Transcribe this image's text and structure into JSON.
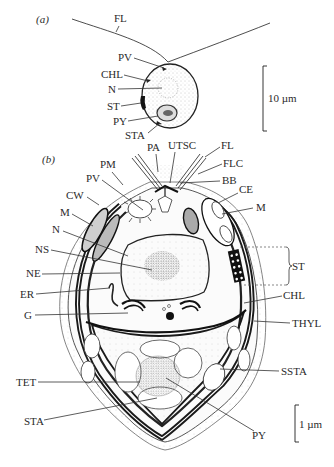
{
  "figure": {
    "panel_a": {
      "tag": "(a)",
      "labels": {
        "fl": "FL",
        "pv": "PV",
        "chl": "CHL",
        "n": "N",
        "st": "ST",
        "py": "PY",
        "sta": "STA"
      },
      "scale_bar": "10 µm"
    },
    "panel_b": {
      "tag": "(b)",
      "labels": {
        "pa": "PA",
        "utsc": "UTSC",
        "fl": "FL",
        "flc": "FLC",
        "bb": "BB",
        "pm": "PM",
        "pv": "PV",
        "cw": "CW",
        "ce": "CE",
        "m_left": "M",
        "m_right": "M",
        "n": "N",
        "ns": "NS",
        "ne": "NE",
        "st": "ST",
        "er": "ER",
        "chl": "CHL",
        "g": "G",
        "thyl": "THYL",
        "tet": "TET",
        "ssta": "SSTA",
        "sta": "STA",
        "py": "PY"
      },
      "scale_bar": "1 µm"
    },
    "colors": {
      "ink": "#1f1f1f",
      "stipple": "#9a9a9a",
      "background": "#ffffff"
    }
  }
}
